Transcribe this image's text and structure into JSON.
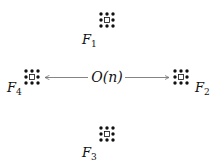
{
  "diagram": {
    "center_label": "O(n)",
    "colors": {
      "ink": "#111111",
      "arrow": "#777777",
      "background": "#ffffff"
    },
    "nodes": [
      {
        "id": "F1",
        "label": "F",
        "subscript": "1",
        "cx": 107,
        "cy": 20,
        "label_x": 82,
        "label_y": 44
      },
      {
        "id": "F2",
        "label": "F",
        "subscript": "2",
        "cx": 181,
        "cy": 77,
        "label_x": 195,
        "label_y": 92
      },
      {
        "id": "F3",
        "label": "F",
        "subscript": "3",
        "cx": 107,
        "cy": 134,
        "label_x": 82,
        "label_y": 157
      },
      {
        "id": "F4",
        "label": "F",
        "subscript": "4",
        "cx": 32,
        "cy": 77,
        "label_x": 7,
        "label_y": 92
      }
    ],
    "node_pattern": "3x3 grid of dots with hollow square at center",
    "edges": [
      {
        "from": "center",
        "to": "F4",
        "direction": "left"
      },
      {
        "from": "center",
        "to": "F2",
        "direction": "right"
      }
    ]
  }
}
